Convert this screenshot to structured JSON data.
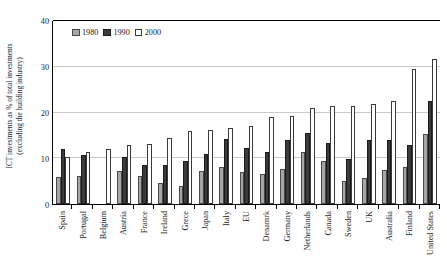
{
  "chart_data": {
    "type": "bar",
    "title": "",
    "xlabel": "",
    "ylabel": "ICT investments as % of total investments (excluding the building industry)",
    "ylabel_line1": "ICT investments as % of total investments",
    "ylabel_line2": "(excluding the building industry)",
    "ylim": [
      0,
      40
    ],
    "yticks": [
      0,
      10,
      20,
      30,
      40
    ],
    "grid": true,
    "legend_position": "top-left",
    "categories": [
      "Spain",
      "Portugal",
      "Belgium",
      "Austria",
      "France",
      "Ireland",
      "Grece",
      "Japan",
      "Italy",
      "EU",
      "Denamrk",
      "Germany",
      "Netherlands",
      "Canada",
      "Sweden",
      "UK",
      "Australia",
      "Finland",
      "United States"
    ],
    "series": [
      {
        "name": "1980",
        "color": "#a6a6a6",
        "values": [
          5.8,
          6.2,
          null,
          7.2,
          6.2,
          4.6,
          3.9,
          7.2,
          8.1,
          7.0,
          6.6,
          7.7,
          11.3,
          9.3,
          5.1,
          5.6,
          7.4,
          8.0,
          15.3
        ]
      },
      {
        "name": "1990",
        "color": "#3b3b3b",
        "values": [
          12.0,
          10.8,
          null,
          10.2,
          8.5,
          8.5,
          9.5,
          11.0,
          14.2,
          12.3,
          11.3,
          14.0,
          15.5,
          13.3,
          9.9,
          13.9,
          14.1,
          13.0,
          22.6
        ]
      },
      {
        "name": "2000",
        "color": "#ffffff",
        "values": [
          10.2,
          11.4,
          12.0,
          12.8,
          13.2,
          14.5,
          15.9,
          16.1,
          16.7,
          17.0,
          19.1,
          19.3,
          21.0,
          21.4,
          21.5,
          21.9,
          22.5,
          29.5,
          31.7
        ]
      }
    ]
  },
  "legend": {
    "items": [
      {
        "label": "1980",
        "swatch": "legend-swatch-1980"
      },
      {
        "label": "1990",
        "swatch": "legend-swatch-1990"
      },
      {
        "label": "2000",
        "swatch": "legend-swatch-2000"
      }
    ]
  }
}
